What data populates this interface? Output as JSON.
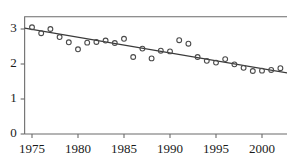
{
  "chart_data": {
    "type": "scatter",
    "title": "",
    "subtitle": "",
    "xlabel": "",
    "ylabel": "",
    "xlim": [
      1974.2,
      2002.8
    ],
    "ylim": [
      0,
      3.35
    ],
    "grid": false,
    "legend": "none",
    "x_ticks": [
      1975,
      1980,
      1985,
      1990,
      1995,
      2000
    ],
    "x_tick_labels": [
      "1975",
      "1980",
      "1985",
      "1990",
      "1995",
      "2000"
    ],
    "y_ticks": [
      0,
      1,
      2,
      3
    ],
    "y_tick_labels": [
      "0",
      "1",
      "2",
      "3"
    ],
    "x": [
      1975,
      1976,
      1977,
      1978,
      1979,
      1980,
      1981,
      1982,
      1983,
      1984,
      1985,
      1986,
      1987,
      1988,
      1989,
      1990,
      1991,
      1992,
      1993,
      1994,
      1995,
      1996,
      1997,
      1998,
      1999,
      2000,
      2001,
      2002
    ],
    "values": [
      3.05,
      2.88,
      3.0,
      2.77,
      2.62,
      2.42,
      2.61,
      2.63,
      2.67,
      2.6,
      2.72,
      2.2,
      2.44,
      2.16,
      2.38,
      2.36,
      2.68,
      2.58,
      2.2,
      2.09,
      2.04,
      2.14,
      1.99,
      1.89,
      1.8,
      1.81,
      1.83,
      1.88
    ],
    "series": [
      {
        "name": "observations",
        "marker": "open-circle",
        "values": [
          3.05,
          2.88,
          3.0,
          2.77,
          2.62,
          2.42,
          2.61,
          2.63,
          2.67,
          2.6,
          2.72,
          2.2,
          2.44,
          2.16,
          2.38,
          2.36,
          2.68,
          2.58,
          2.2,
          2.09,
          2.04,
          2.14,
          1.99,
          1.89,
          1.8,
          1.81,
          1.83,
          1.88
        ]
      },
      {
        "name": "trend-line",
        "type": "line",
        "x": [
          1975,
          2002
        ],
        "values": [
          2.99,
          1.78
        ]
      }
    ]
  }
}
